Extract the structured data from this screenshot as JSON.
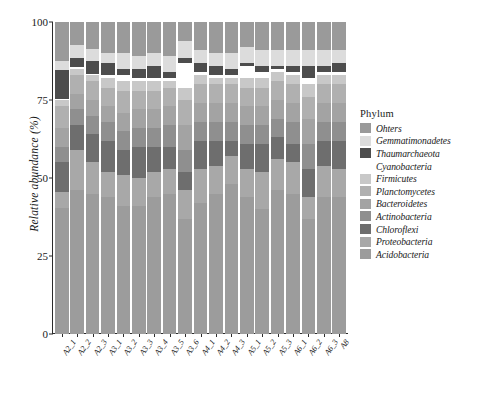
{
  "chart_data": {
    "type": "bar",
    "subtype": "stacked-bar-100",
    "title": "",
    "xlabel": "",
    "ylabel": "Relative abundance (%)",
    "ylim": [
      0,
      100
    ],
    "yticks": [
      0,
      25,
      50,
      75,
      100
    ],
    "grid": false,
    "legend_title": "Phylum",
    "legend_position": "right",
    "categories": [
      "A2_1",
      "A2_2",
      "A2_3",
      "A3_1",
      "A3_2",
      "A3_3",
      "A3_4",
      "A3_5",
      "A3_6",
      "A4_1",
      "A4_2",
      "A4_3",
      "A5_1",
      "A5_2",
      "A5_3",
      "A6_1",
      "A6_2",
      "A6_3",
      "A8"
    ],
    "series": [
      {
        "name": "Acidobacteria",
        "color": "#9c9c9c",
        "values": [
          40.5,
          46.0,
          45.0,
          44.0,
          41.0,
          41.0,
          44.0,
          45.0,
          37.0,
          42.0,
          45.0,
          48.0,
          44.0,
          40.0,
          46.0,
          45.0,
          37.0,
          44.0,
          44.0
        ]
      },
      {
        "name": "Proteobacteria",
        "color": "#a8a8a8",
        "values": [
          5.0,
          13.0,
          10.0,
          8.0,
          10.0,
          9.0,
          8.0,
          8.0,
          9.0,
          11.0,
          9.0,
          9.0,
          9.0,
          12.0,
          10.0,
          10.0,
          7.0,
          10.0,
          9.0
        ]
      },
      {
        "name": "Chloroflexi",
        "color": "#6e6e6e",
        "values": [
          9.5,
          8.0,
          9.0,
          10.0,
          8.0,
          10.0,
          8.0,
          7.0,
          6.0,
          9.0,
          8.0,
          5.0,
          8.0,
          9.0,
          7.0,
          6.0,
          9.0,
          8.0,
          9.0
        ]
      },
      {
        "name": "Actinobacteria",
        "color": "#8f8f8f",
        "values": [
          5.0,
          5.0,
          6.0,
          6.0,
          6.0,
          6.0,
          6.0,
          7.0,
          7.0,
          6.0,
          6.0,
          6.0,
          6.0,
          6.0,
          6.0,
          7.0,
          8.0,
          6.0,
          6.0
        ]
      },
      {
        "name": "Bacteroidetes",
        "color": "#a3a3a3",
        "values": [
          6.0,
          5.0,
          5.0,
          5.0,
          6.0,
          6.0,
          6.0,
          6.0,
          8.0,
          6.0,
          6.0,
          6.0,
          6.0,
          6.0,
          6.0,
          6.0,
          8.0,
          6.0,
          6.0
        ]
      },
      {
        "name": "Planctomycetes",
        "color": "#b0b0b0",
        "values": [
          7.0,
          6.0,
          6.0,
          6.0,
          7.0,
          6.0,
          6.0,
          6.0,
          8.0,
          6.0,
          6.0,
          6.0,
          6.0,
          6.0,
          6.0,
          6.0,
          7.0,
          6.0,
          6.0
        ]
      },
      {
        "name": "Firmicutes",
        "color": "#c8c8c8",
        "values": [
          2.0,
          2.0,
          2.0,
          3.0,
          3.0,
          3.0,
          3.0,
          2.0,
          4.0,
          3.0,
          2.0,
          2.0,
          3.0,
          3.0,
          3.0,
          3.0,
          4.0,
          3.0,
          3.0
        ]
      },
      {
        "name": "Cyanobacteria",
        "color": "#ffffff",
        "values": [
          0.5,
          0.5,
          0.5,
          1.0,
          2.0,
          1.0,
          1.0,
          1.0,
          8.0,
          1.0,
          1.0,
          1.0,
          4.0,
          2.0,
          1.0,
          1.0,
          2.0,
          1.0,
          1.0
        ]
      },
      {
        "name": "Thaumarchaeota",
        "color": "#4d4d4d",
        "values": [
          9.0,
          3.0,
          4.0,
          4.0,
          2.0,
          3.0,
          4.0,
          2.0,
          1.5,
          3.0,
          3.0,
          2.0,
          1.0,
          2.0,
          1.0,
          2.0,
          4.0,
          2.0,
          3.0
        ]
      },
      {
        "name": "Gemmatimonadetes",
        "color": "#dcdcdc",
        "values": [
          3.0,
          4.0,
          4.0,
          3.0,
          5.0,
          4.0,
          4.0,
          5.0,
          5.5,
          4.0,
          4.0,
          5.0,
          5.0,
          5.0,
          5.0,
          5.0,
          5.0,
          5.0,
          4.0
        ]
      },
      {
        "name": "Ohters",
        "color": "#9a9a9a",
        "values": [
          12.5,
          7.5,
          8.5,
          10.0,
          10.0,
          11.0,
          10.0,
          11.0,
          6.0,
          9.0,
          10.0,
          10.0,
          8.0,
          9.0,
          9.0,
          9.0,
          9.0,
          9.0,
          9.0
        ]
      }
    ],
    "legend_order": [
      "Ohters",
      "Gemmatimonadetes",
      "Thaumarchaeota",
      "Cyanobacteria",
      "Firmicutes",
      "Planctomycetes",
      "Bacteroidetes",
      "Actinobacteria",
      "Chloroflexi",
      "Proteobacteria",
      "Acidobacteria"
    ]
  }
}
